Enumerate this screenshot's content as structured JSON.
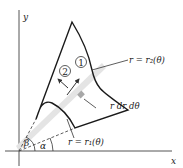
{
  "diagram": {
    "axes": {
      "x_label": "x",
      "y_label": "y"
    },
    "curves": {
      "outer_label": "r = r₂(θ)",
      "inner_label": "r = r₁(θ)"
    },
    "element": {
      "label": "r dr dθ"
    },
    "angles": {
      "alpha": "α",
      "beta": "β"
    },
    "markers": {
      "one": "1",
      "two": "2"
    },
    "colors": {
      "stroke": "#1a1a1a",
      "strip": "#e2e2e2",
      "element": "#a8a8a8",
      "axis": "#555555"
    }
  }
}
